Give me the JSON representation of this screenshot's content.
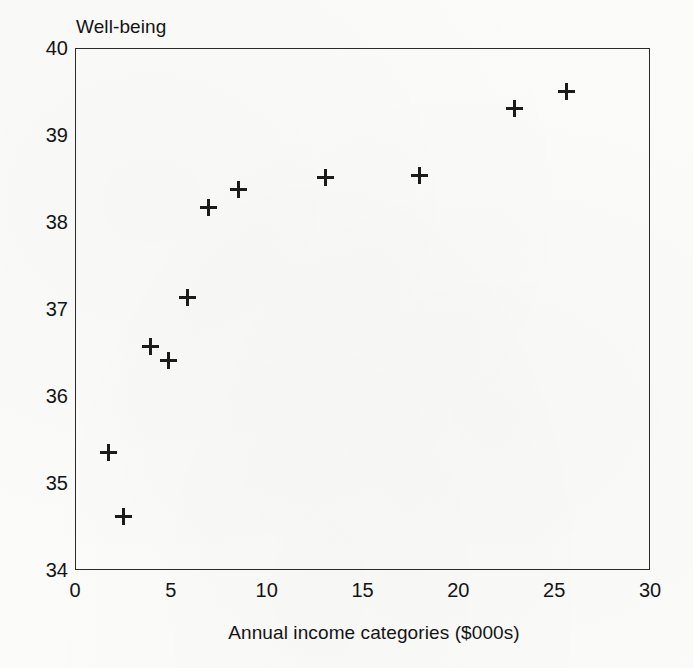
{
  "chart_data": {
    "type": "scatter",
    "title": "",
    "xlabel": "Annual income categories ($000s)",
    "ylabel": "Well-being",
    "xlim": [
      0,
      30
    ],
    "ylim": [
      34,
      40
    ],
    "xticks": [
      0,
      5,
      10,
      15,
      20,
      25,
      30
    ],
    "yticks": [
      34,
      35,
      36,
      37,
      38,
      39,
      40
    ],
    "xtick_labels": [
      "0",
      "5",
      "10",
      "15",
      "20",
      "25",
      "30"
    ],
    "ytick_labels": [
      "34",
      "35",
      "36",
      "37",
      "38",
      "39",
      "40"
    ],
    "grid": false,
    "legend": null,
    "marker": "plus",
    "marker_color": "#1b1b1b",
    "series": [
      {
        "name": "Well-being by income category",
        "points": [
          {
            "x": 1.7,
            "y": 35.36
          },
          {
            "x": 2.5,
            "y": 34.63
          },
          {
            "x": 3.9,
            "y": 36.58
          },
          {
            "x": 4.8,
            "y": 36.42
          },
          {
            "x": 5.8,
            "y": 37.14
          },
          {
            "x": 6.9,
            "y": 38.18
          },
          {
            "x": 8.5,
            "y": 38.39
          },
          {
            "x": 13.0,
            "y": 38.52
          },
          {
            "x": 17.9,
            "y": 38.55
          },
          {
            "x": 22.9,
            "y": 39.32
          },
          {
            "x": 25.6,
            "y": 39.51
          }
        ]
      }
    ]
  },
  "colors": {
    "axis": "#2a2a2a",
    "text": "#141414",
    "background": "#fbfbfa",
    "marker": "#1b1b1b"
  }
}
